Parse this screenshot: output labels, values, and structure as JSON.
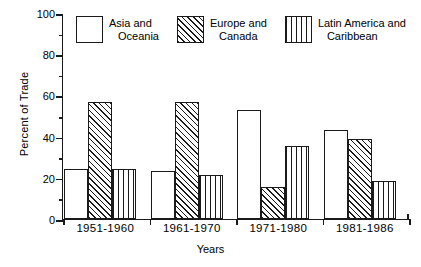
{
  "chart_data": {
    "type": "bar",
    "title": "",
    "xlabel": "Years",
    "ylabel": "Percent of Trade",
    "ylim": [
      0,
      100
    ],
    "ytick_values": [
      0,
      20,
      40,
      60,
      80,
      100
    ],
    "ytick_labels": [
      "0",
      "20",
      "40",
      "60",
      "80",
      "100"
    ],
    "yminor_values": [
      10,
      30,
      50,
      70,
      90
    ],
    "grid": false,
    "legend_position": "top",
    "categories": [
      "1951-1960",
      "1961-1970",
      "1971-1980",
      "1981-1986"
    ],
    "series": [
      {
        "name": "Asia and Oceania",
        "name_line1": "Asia and",
        "name_line2": "Oceania",
        "pattern": "plain",
        "values": [
          24.5,
          23.5,
          53,
          43
        ]
      },
      {
        "name": "Europe and Canada",
        "name_line1": "Europe and",
        "name_line2": "Canada",
        "pattern": "hatch",
        "values": [
          57,
          57,
          15.5,
          39
        ]
      },
      {
        "name": "Latin America and Caribbean",
        "name_line1": "Latin America and",
        "name_line2": "Caribbean",
        "pattern": "vert",
        "values": [
          24.5,
          21.5,
          35.5,
          18.5
        ]
      }
    ]
  },
  "colors": {
    "ink": "#1a1a1a",
    "background": "#ffffff"
  }
}
